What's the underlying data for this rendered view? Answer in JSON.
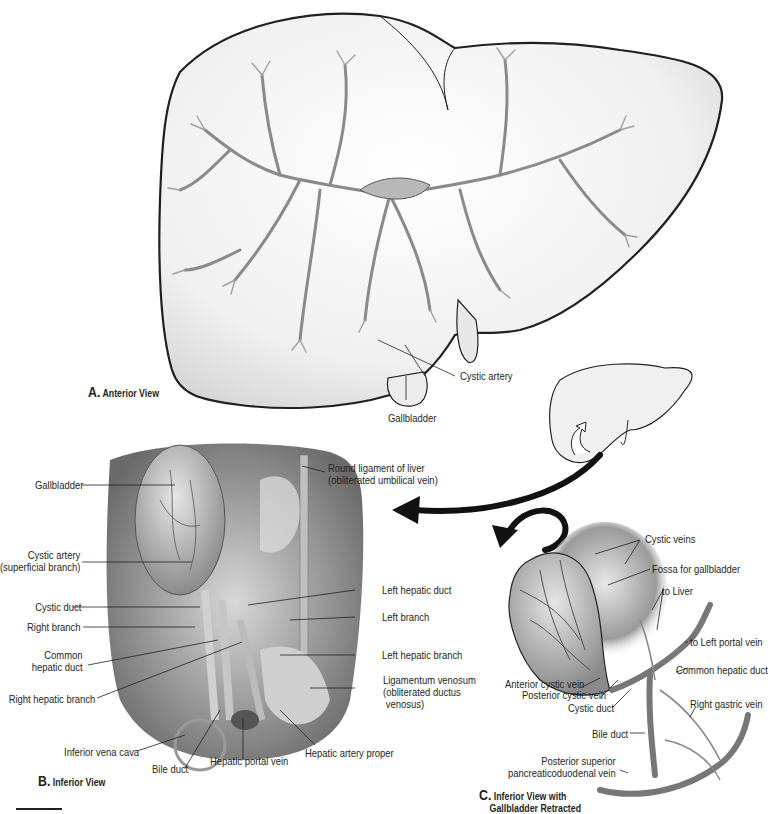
{
  "figure": {
    "panels": [
      {
        "id": "A",
        "letter": "A.",
        "title": "Anterior View",
        "labels": [
          {
            "text": "Cystic artery"
          },
          {
            "text": "Gallbladder"
          }
        ]
      },
      {
        "id": "B",
        "letter": "B.",
        "title": "Inferior View",
        "labels": [
          {
            "text": "Gallbladder"
          },
          {
            "text": "Round ligament of liver",
            "text2": "(obliterated umbilical vein)"
          },
          {
            "text": "Cystic artery",
            "text2": "(superficial branch)"
          },
          {
            "text": "Left hepatic duct"
          },
          {
            "text": "Cystic duct"
          },
          {
            "text": "Left branch"
          },
          {
            "text": "Right branch"
          },
          {
            "text": "Common",
            "text2": "hepatic duct"
          },
          {
            "text": "Left hepatic branch"
          },
          {
            "text": "Right hepatic branch"
          },
          {
            "text": "Ligamentum venosum",
            "text2": "(obliterated ductus",
            "text3": "venosus)"
          },
          {
            "text": "Inferior vena cava"
          },
          {
            "text": "Bile duct"
          },
          {
            "text": "Hepatic portal vein"
          },
          {
            "text": "Hepatic artery proper"
          }
        ]
      },
      {
        "id": "C",
        "letter": "C.",
        "title": "Inferior View with",
        "title2": "Gallbladder Retracted",
        "labels": [
          {
            "text": "Cystic veins"
          },
          {
            "text": "Fossa for gallbladder"
          },
          {
            "text": "to Liver"
          },
          {
            "text": "to Left portal vein"
          },
          {
            "text": "Common hepatic duct"
          },
          {
            "text": "Anterior cystic vein"
          },
          {
            "text": "Posterior cystic vein"
          },
          {
            "text": "Cystic duct"
          },
          {
            "text": "Right gastric vein"
          },
          {
            "text": "Bile duct"
          },
          {
            "text": "Posterior superior",
            "text2": "pancreaticoduodenal vein"
          }
        ]
      }
    ],
    "colors": {
      "outline": "#231f20",
      "liver_fill": "#f2f2f2",
      "vessel": "#8c8c8c",
      "tissue_dark": "#6e6e6e",
      "tissue_light": "#c8c8c8"
    }
  }
}
